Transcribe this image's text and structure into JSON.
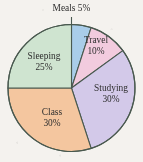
{
  "figure": {
    "background_color": "#f4f2ee",
    "outline_color": "#49594f"
  },
  "chart_data": {
    "type": "pie",
    "title": "",
    "subtitle": "",
    "xlabel": "",
    "ylabel": "",
    "legend_position": "none",
    "grid": false,
    "units": "percent",
    "total": 100,
    "start_angle_deg": 0,
    "direction": "clockwise",
    "categories": [
      "Meals",
      "Travel",
      "Studying",
      "Class",
      "Sleeping"
    ],
    "values": [
      5,
      10,
      30,
      30,
      25
    ],
    "slices": [
      {
        "name": "Meals",
        "value": 5,
        "value_label": "5%",
        "label_line1": "Meals 5%",
        "label_line2": "",
        "color": "#a9cde9",
        "label_placement": "outside-callout",
        "has_leader_line": true,
        "start_deg": 0,
        "end_deg": 18,
        "label_x": 71.5,
        "label_y": 8
      },
      {
        "name": "Travel",
        "value": 10,
        "value_label": "10%",
        "label_line1": "Travel",
        "label_line2": "10%",
        "color": "#f2cbde",
        "label_placement": "inside",
        "has_leader_line": false,
        "start_deg": 18,
        "end_deg": 54,
        "label_x": 96,
        "label_y": 45
      },
      {
        "name": "Studying",
        "value": 30,
        "value_label": "30%",
        "label_line1": "Studying",
        "label_line2": "30%",
        "color": "#d3c9e9",
        "label_placement": "inside",
        "has_leader_line": false,
        "start_deg": 54,
        "end_deg": 162,
        "label_x": 111,
        "label_y": 94
      },
      {
        "name": "Class",
        "value": 30,
        "value_label": "30%",
        "label_line1": "Class",
        "label_line2": "30%",
        "color": "#f4c69f",
        "label_placement": "inside",
        "has_leader_line": false,
        "start_deg": 162,
        "end_deg": 270,
        "label_x": 52,
        "label_y": 118
      },
      {
        "name": "Sleeping",
        "value": 25,
        "value_label": "25%",
        "label_line1": "Sleeping",
        "label_line2": "25%",
        "color": "#cfe4d0",
        "label_placement": "inside",
        "has_leader_line": false,
        "start_deg": 270,
        "end_deg": 360,
        "label_x": 44,
        "label_y": 62
      }
    ]
  }
}
